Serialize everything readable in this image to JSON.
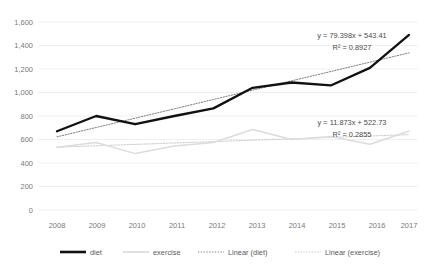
{
  "chart_data": {
    "type": "line",
    "title": "",
    "subtitle": "",
    "xlabel": "",
    "ylabel": "",
    "grid": "horizontal",
    "legend_position": "bottom",
    "categories": [
      "2008",
      "2009",
      "2010",
      "2011",
      "2012",
      "2013",
      "2014",
      "2015",
      "2016",
      "2017"
    ],
    "x": [
      2008,
      2009,
      2010,
      2011,
      2012,
      2013,
      2014,
      2015,
      2016,
      2017
    ],
    "ylim": [
      0,
      1600
    ],
    "yticks": [
      "0",
      "200",
      "400",
      "600",
      "800",
      "1,000",
      "1,200",
      "1,400",
      "1,600"
    ],
    "ytick_values": [
      0,
      200,
      400,
      600,
      800,
      1000,
      1200,
      1400,
      1600
    ],
    "series": [
      {
        "name": "diet",
        "style": "solid",
        "color": "#111111",
        "values": [
          670,
          800,
          730,
          800,
          865,
          1040,
          1085,
          1060,
          1210,
          1490
        ]
      },
      {
        "name": "exercise",
        "style": "solid",
        "color": "#dcdcdc",
        "values": [
          535,
          575,
          480,
          545,
          575,
          685,
          600,
          625,
          560,
          670
        ]
      },
      {
        "name": "Linear (diet)",
        "style": "dotted",
        "color": "#7d7d7d",
        "values": [
          622.8,
          702.2,
          781.6,
          861.0,
          940.4,
          1019.8,
          1099.2,
          1178.6,
          1258.0,
          1337.4
        ]
      },
      {
        "name": "Linear (exercise)",
        "style": "dotted",
        "color": "#c9c9c9",
        "values": [
          534.6,
          546.5,
          558.3,
          570.2,
          582.1,
          594.0,
          605.8,
          617.7,
          629.6,
          641.5
        ]
      }
    ],
    "annotations": [
      {
        "id": "diet-trendline-equation",
        "equation": "y = 79.398x + 543.41",
        "r_squared": "R² = 0.8927",
        "slope": 79.398,
        "intercept": 543.41,
        "r2_value": 0.8927,
        "for_series": "diet"
      },
      {
        "id": "exercise-trendline-equation",
        "equation": "y = 11.873x + 522.73",
        "r_squared": "R² = 0.2855",
        "slope": 11.873,
        "intercept": 522.73,
        "r2_value": 0.2855,
        "for_series": "exercise"
      }
    ],
    "legend": [
      {
        "label": "diet",
        "marker": "solid-thick-black"
      },
      {
        "label": "exercise",
        "marker": "solid-light-gray"
      },
      {
        "label": "Linear (diet)",
        "marker": "dotted-gray"
      },
      {
        "label": "Linear (exercise)",
        "marker": "dotted-light-gray"
      }
    ]
  }
}
